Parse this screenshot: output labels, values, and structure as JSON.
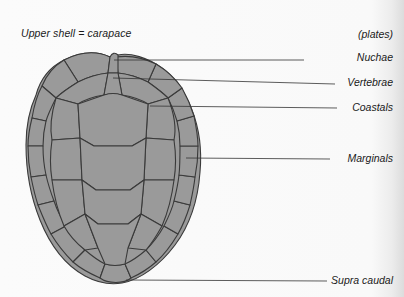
{
  "title": "Upper shell = carapace",
  "legend_header": "(plates)",
  "labels": [
    {
      "text": "Nuchae",
      "y": 57
    },
    {
      "text": "Vertebrae",
      "y": 79
    },
    {
      "text": "Coastals",
      "y": 104
    },
    {
      "text": "Marginals",
      "y": 155
    },
    {
      "text": "Supra caudal",
      "y": 279
    }
  ],
  "colors": {
    "scute_fill": "#9a9a9a",
    "scute_stroke": "#3a3a3a",
    "leader_line": "#333333",
    "background": "#fafafa"
  }
}
